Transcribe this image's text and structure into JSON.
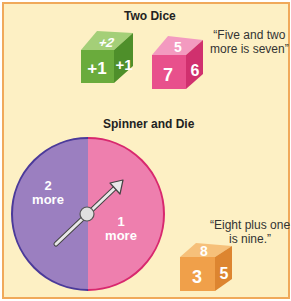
{
  "section1": {
    "title": "Two Dice",
    "quote_line1": "“Five and two",
    "quote_line2": "more is seven”",
    "green_die": {
      "top": "+2",
      "front": "+1",
      "side": "+1",
      "color": "#6aab3c"
    },
    "pink_die": {
      "top": "5",
      "front": "7",
      "side": "6",
      "color": "#e8508c"
    }
  },
  "section2": {
    "title": "Spinner and Die",
    "spinner": {
      "left_label_num": "2",
      "left_label_word": "more",
      "right_label_num": "1",
      "right_label_word": "more",
      "left_color": "#9b7fc0",
      "right_color": "#ee7fae"
    },
    "quote_line1": "“Eight plus one",
    "quote_line2": "is nine.”",
    "orange_die": {
      "top": "8",
      "front": "3",
      "side": "5",
      "color": "#f0a04a"
    }
  }
}
